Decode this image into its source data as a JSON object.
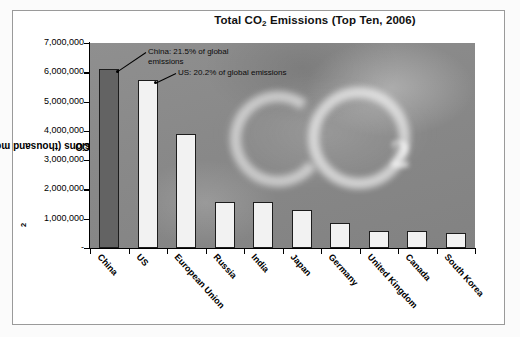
{
  "chart_data": {
    "type": "bar",
    "title": "Total CO2 Emissions (Top Ten, 2006)",
    "title_prefix": "Total CO",
    "title_sub": "2",
    "title_suffix": " Emissions (Top Ten, 2006)",
    "xlabel": "",
    "ylabel": "CO2 Emissions (thousand metric tons)",
    "ylabel_prefix": "CO",
    "ylabel_sub": "2",
    "ylabel_suffix": " Emissions (thousand metric tons)",
    "categories": [
      "China",
      "US",
      "European Union",
      "Russia",
      "India",
      "Japan",
      "Germany",
      "United Kingdom",
      "Canada",
      "South Korea"
    ],
    "values": [
      6100000,
      5750000,
      3900000,
      1560000,
      1560000,
      1290000,
      860000,
      590000,
      590000,
      510000
    ],
    "ylim": [
      0,
      7000000
    ],
    "ytick_values": [
      7000000,
      6000000,
      5000000,
      4000000,
      3000000,
      2000000,
      1000000,
      0
    ],
    "ytick_labels": [
      "7,000,000",
      "6,000,000",
      "5,000,000",
      "4,000,000",
      "3,000,000",
      "2,000,000",
      "1,000,000",
      "-"
    ],
    "grid": false,
    "legend": false,
    "bar_colors": [
      "#636363",
      "#f2f2f2",
      "#f2f2f2",
      "#f2f2f2",
      "#f2f2f2",
      "#f2f2f2",
      "#f2f2f2",
      "#f2f2f2",
      "#f2f2f2",
      "#f2f2f2"
    ],
    "plot_background": "#8b8b8b",
    "background_watermark": "CO2 smoke",
    "annotations": [
      {
        "text": "China: 21.5% of global emissions",
        "target_category": "China"
      },
      {
        "text": "US: 20.2% of global emissions",
        "target_category": "US"
      }
    ]
  },
  "annotations": {
    "china": "China: 21.5% of global emissions",
    "us": "US: 20.2% of global emissions"
  }
}
